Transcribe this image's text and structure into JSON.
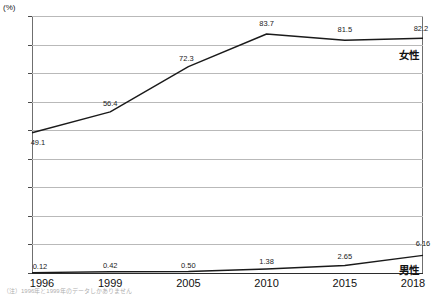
{
  "chart_data": {
    "type": "line",
    "title": "",
    "xlabel": "",
    "ylabel": "",
    "unit_label": "(%)",
    "ylim": [
      0,
      90
    ],
    "yticks": [
      0,
      10,
      20,
      30,
      40,
      50,
      60,
      70,
      80,
      90
    ],
    "grid": true,
    "legend_position": "inline-right",
    "categories": [
      "1996",
      "1999",
      "2005",
      "2010",
      "2015",
      "2018"
    ],
    "series": [
      {
        "name": "女性",
        "values": [
          49.1,
          56.4,
          72.3,
          83.7,
          81.5,
          82.2
        ],
        "labels": [
          "49.1",
          "56.4",
          "72.3",
          "83.7",
          "81.5",
          "82.2"
        ],
        "color": "#1a1a1a"
      },
      {
        "name": "男性",
        "values": [
          0.12,
          0.42,
          0.5,
          1.38,
          2.65,
          6.16
        ],
        "labels": [
          "0.12",
          "0.42",
          "0.50",
          "1.38",
          "2.65",
          "6.16"
        ],
        "color": "#1a1a1a"
      }
    ]
  },
  "footnote": "（注）1996年と1999年のデータしかありません"
}
